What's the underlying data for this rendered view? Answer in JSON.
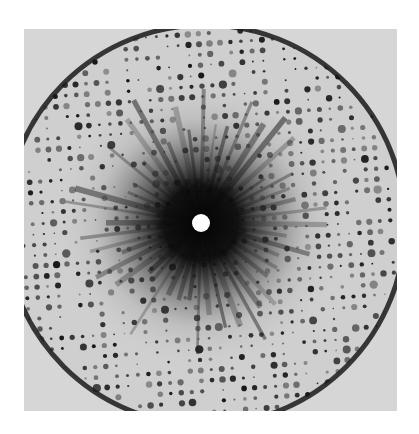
{
  "image": {
    "subject": "X-ray diffraction pattern photograph",
    "frame": {
      "x": 24,
      "y": 29,
      "width": 373,
      "height": 382
    },
    "background_color": "#d6d6d6",
    "spot_color": "#141414",
    "center_hole": {
      "cx": 177,
      "cy": 194,
      "r": 9,
      "color": "#ffffff"
    },
    "boundary_circle": {
      "cx": 181,
      "cy": 196,
      "r": 200,
      "stroke": "#1a1a1a"
    },
    "lattice": {
      "spacing_x": 10.5,
      "spacing_y": 10.5,
      "tilt_deg": -4
    }
  }
}
